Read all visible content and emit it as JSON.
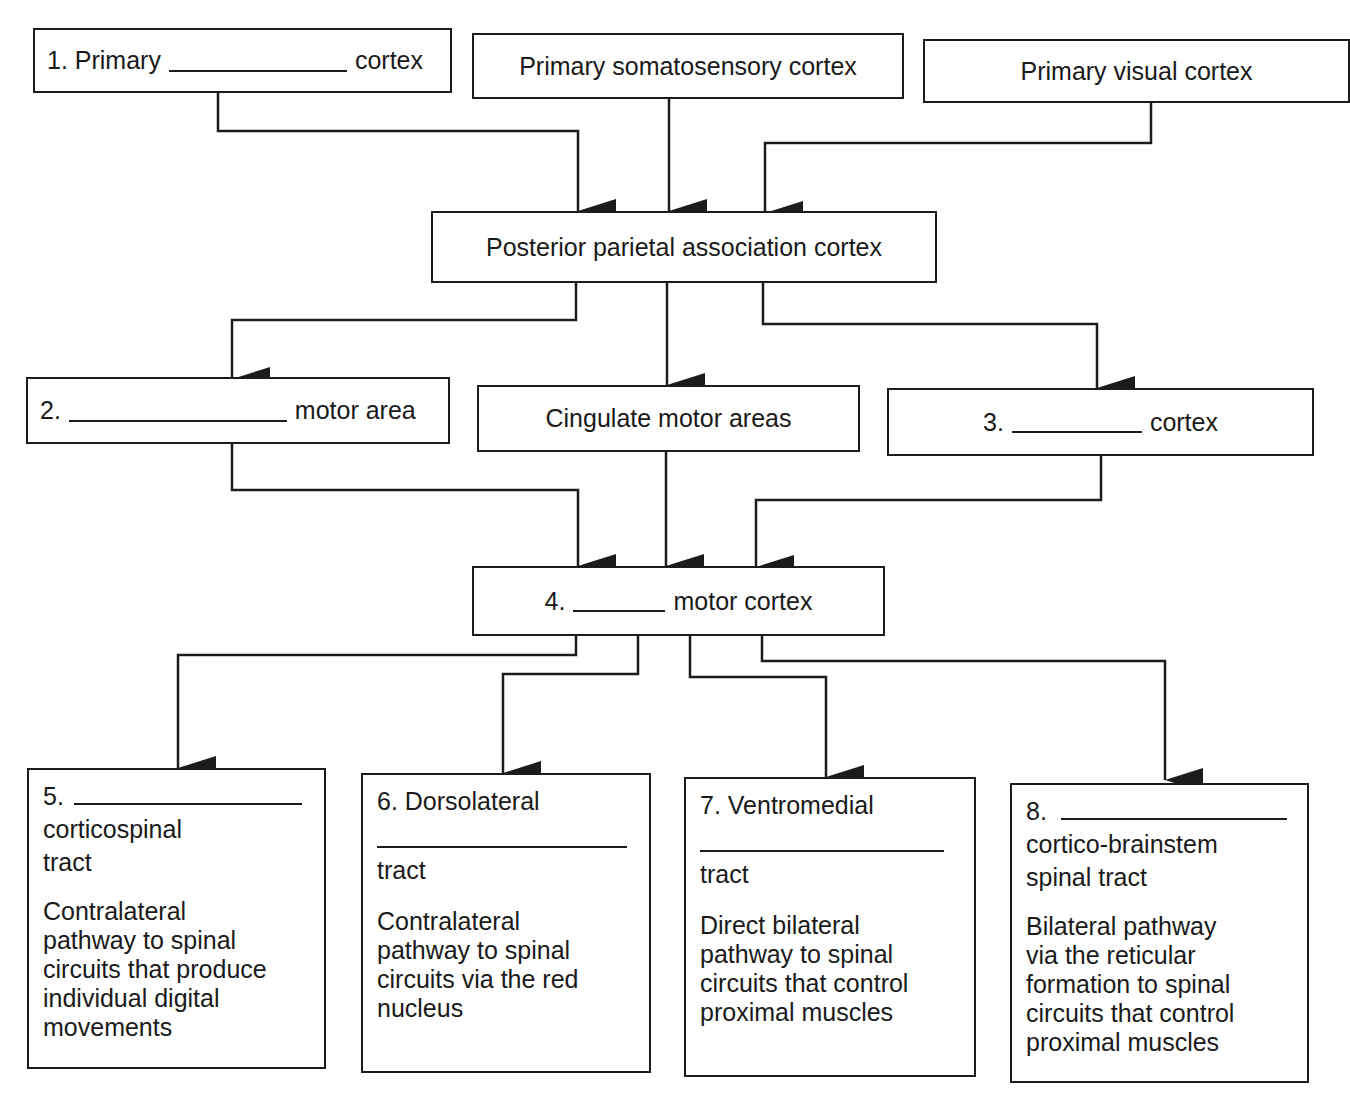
{
  "diagram": {
    "type": "flowchart",
    "row1": {
      "primary_blank": {
        "number": "1.",
        "prefix": "Primary",
        "suffix": "cortex"
      },
      "somatosensory": {
        "label": "Primary somatosensory cortex"
      },
      "visual": {
        "label": "Primary visual cortex"
      }
    },
    "row2": {
      "parietal": {
        "label": "Posterior parietal association cortex"
      }
    },
    "row3": {
      "motor_area": {
        "number": "2.",
        "suffix": "motor area"
      },
      "cingulate": {
        "label": "Cingulate motor areas"
      },
      "cortex3": {
        "number": "3.",
        "suffix": "cortex"
      }
    },
    "row4": {
      "motor_cortex": {
        "number": "4.",
        "suffix": "motor cortex"
      }
    },
    "row5": [
      {
        "number": "5.",
        "title_lines": [
          "corticospinal",
          "tract"
        ],
        "description": [
          "Contralateral",
          "pathway to spinal",
          "circuits that produce",
          "individual digital",
          "movements"
        ]
      },
      {
        "number": "6.",
        "title_word": "Dorsolateral",
        "title_lines": [
          "tract"
        ],
        "description": [
          "Contralateral",
          "pathway to spinal",
          "circuits via the red",
          "nucleus"
        ]
      },
      {
        "number": "7.",
        "title_word": "Ventromedial",
        "title_lines": [
          "tract"
        ],
        "description": [
          "Direct bilateral",
          "pathway to spinal",
          "circuits that control",
          "proximal muscles"
        ]
      },
      {
        "number": "8.",
        "title_lines": [
          "cortico-brainstem",
          "spinal tract"
        ],
        "description": [
          "Bilateral pathway",
          "via the reticular",
          "formation to spinal",
          "circuits that control",
          "proximal muscles"
        ]
      }
    ],
    "edges": [
      [
        "1. Primary ___ cortex",
        "Posterior parietal association cortex"
      ],
      [
        "Primary somatosensory cortex",
        "Posterior parietal association cortex"
      ],
      [
        "Primary visual cortex",
        "Posterior parietal association cortex"
      ],
      [
        "Posterior parietal association cortex",
        "2. ___ motor area"
      ],
      [
        "Posterior parietal association cortex",
        "Cingulate motor areas"
      ],
      [
        "Posterior parietal association cortex",
        "3. ___ cortex"
      ],
      [
        "2. ___ motor area",
        "4. ___ motor cortex"
      ],
      [
        "Cingulate motor areas",
        "4. ___ motor cortex"
      ],
      [
        "3. ___ cortex",
        "4. ___ motor cortex"
      ],
      [
        "4. ___ motor cortex",
        "5. ___ corticospinal tract"
      ],
      [
        "4. ___ motor cortex",
        "6. Dorsolateral ___ tract"
      ],
      [
        "4. ___ motor cortex",
        "7. Ventromedial ___ tract"
      ],
      [
        "4. ___ motor cortex",
        "8. ___ cortico-brainstem spinal tract"
      ]
    ],
    "colors": {
      "ink": "#1c1c1c",
      "background": "#ffffff"
    }
  }
}
